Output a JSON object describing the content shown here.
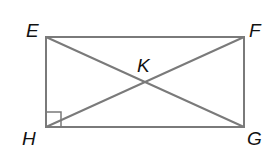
{
  "diagram": {
    "type": "rectangle-with-diagonals",
    "stroke_color": "#7a7a7a",
    "label_color": "#111111",
    "vertices": [
      {
        "id": "E",
        "label": "E",
        "x": 46,
        "y": 37,
        "label_x": 26,
        "label_y": 37
      },
      {
        "id": "F",
        "label": "F",
        "x": 244,
        "y": 37,
        "label_x": 249,
        "label_y": 37
      },
      {
        "id": "G",
        "label": "G",
        "x": 244,
        "y": 127,
        "label_x": 247,
        "label_y": 145
      },
      {
        "id": "H",
        "label": "H",
        "x": 46,
        "y": 127,
        "label_x": 22,
        "label_y": 145
      }
    ],
    "intersection": {
      "id": "K",
      "label": "K",
      "x": 145,
      "y": 82,
      "label_x": 137,
      "label_y": 72
    },
    "segments": [
      "EF",
      "FG",
      "GH",
      "HE",
      "EG",
      "FH"
    ],
    "right_angle_marker": {
      "at": "H",
      "size": 15
    }
  }
}
